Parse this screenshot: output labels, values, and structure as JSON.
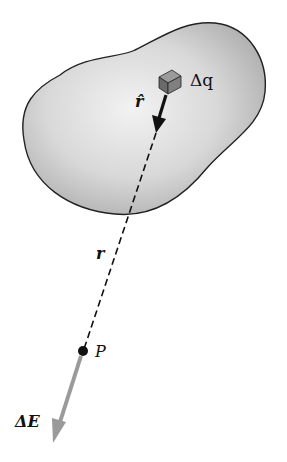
{
  "figure": {
    "labels": {
      "charge_element": "Δq",
      "unit_vector": "r̂",
      "distance": "r",
      "point": "P",
      "field": "ΔE"
    },
    "colors": {
      "blob_fill": "#d6d6d6",
      "blob_outline": "#222222",
      "field_arrow": "#9a9a9a",
      "unit_arrow": "#111111",
      "cube": "#6e6e6e"
    }
  }
}
